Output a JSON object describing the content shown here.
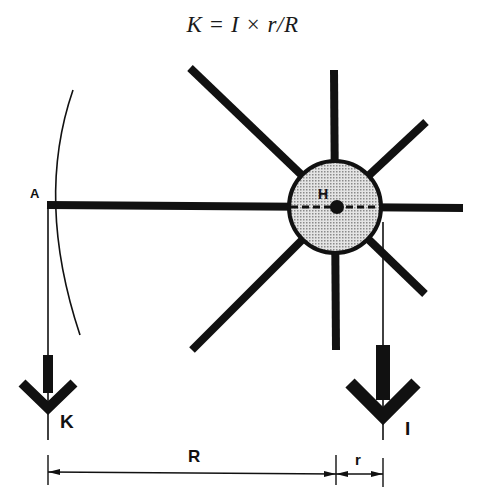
{
  "formula": "K = I × r/R",
  "labels": {
    "pivot": "H",
    "point_a": "A",
    "force_k": "K",
    "force_i": "I",
    "distance_big": "R",
    "distance_small": "r"
  },
  "colors": {
    "ink": "#111111",
    "hub_fill": "#cfcfcf",
    "background": "#ffffff"
  }
}
